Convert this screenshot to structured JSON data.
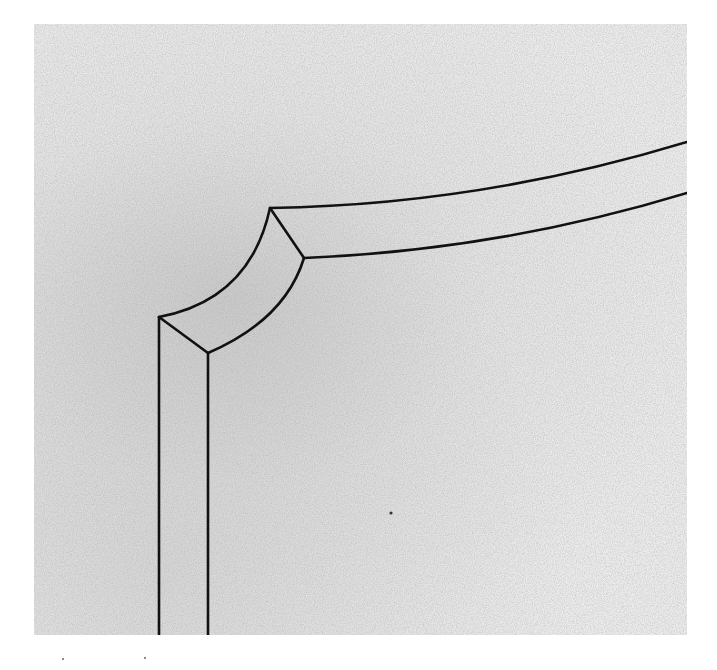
{
  "figure": {
    "background_color": "#ececec",
    "line_color": "#111111",
    "panel": {
      "x": 34,
      "y": 24,
      "width": 653,
      "height": 611
    }
  },
  "shapes": {
    "outer_vertical": {
      "x1": 159,
      "y1": 317,
      "x2": 159,
      "y2": 635
    },
    "inner_vertical": {
      "x1": 208,
      "y1": 353,
      "x2": 208,
      "y2": 635
    },
    "outer_arc": "M159 317 Q250 300 270 208",
    "inner_arc": "M208 353 Q285 320 304 258",
    "lower_mitre": {
      "x1": 159,
      "y1": 317,
      "x2": 208,
      "y2": 353
    },
    "upper_mitre": {
      "x1": 270,
      "y1": 208,
      "x2": 304,
      "y2": 258
    },
    "top_outer_curve": "M270 208 Q480 205 687 142",
    "top_inner_curve": "M304 258 Q500 250 687 193"
  }
}
